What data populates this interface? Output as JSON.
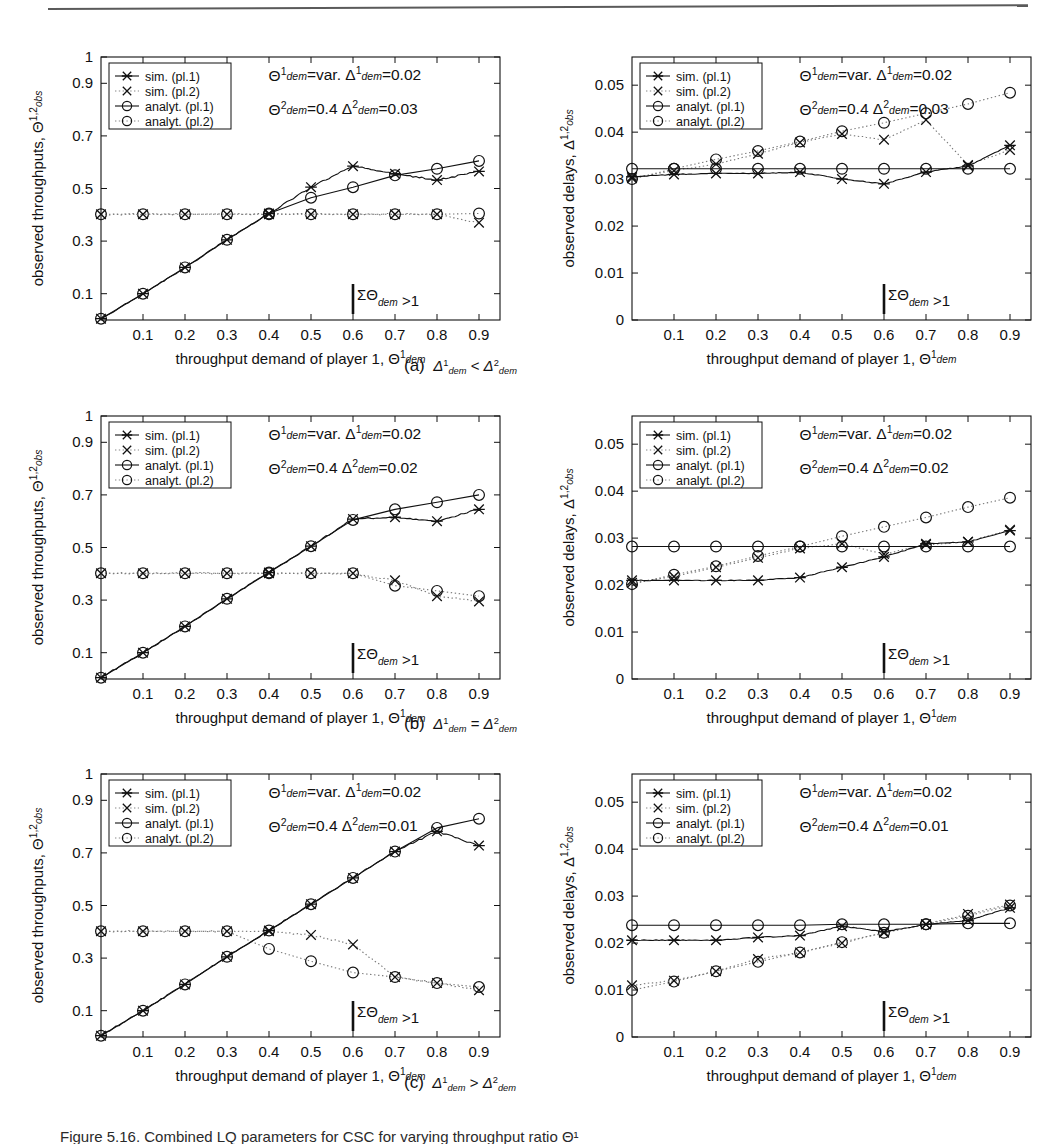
{
  "figure": {
    "panel_captions": [
      {
        "id": "a",
        "label": "(a)",
        "relation": "Δ¹dem < Δ²dem"
      },
      {
        "id": "b",
        "label": "(b)",
        "relation": "Δ¹dem = Δ²dem"
      },
      {
        "id": "c",
        "label": "(c)",
        "relation": "Δ¹dem > Δ²dem"
      }
    ],
    "bottom_caption": "Figure 5.16.   Combined LQ parameters for CSC for varying throughput ratio Θ¹"
  },
  "legend": {
    "entries": [
      {
        "key": "sim1",
        "label": "sim. (pl.1)",
        "marker": "star-line",
        "style": "solid"
      },
      {
        "key": "sim2",
        "label": "sim. (pl.2)",
        "marker": "cross",
        "style": "dotted"
      },
      {
        "key": "ana1",
        "label": "analyt. (pl.1)",
        "marker": "circle-line",
        "style": "solid"
      },
      {
        "key": "ana2",
        "label": "analyt. (pl.2)",
        "marker": "circle",
        "style": "dotted"
      }
    ]
  },
  "axes_common": {
    "xlabel_plain": "throughput demand of player 1, ",
    "xlabel_sym": "Θ",
    "xlabel_sup": "1",
    "xlabel_sub": "dem",
    "xticks": [
      "0.1",
      "0.2",
      "0.3",
      "0.4",
      "0.5",
      "0.6",
      "0.7",
      "0.8",
      "0.9"
    ],
    "xlim": [
      0,
      0.95
    ],
    "threshold_label": "ΣΘ",
    "threshold_sub": "dem",
    "threshold_rel": " >1",
    "threshold_x": 0.6
  },
  "chart_data": [
    {
      "id": "a-left",
      "type": "line",
      "title": "",
      "ylabel_plain": "observed throughputs, ",
      "ylabel_sym": "Θ",
      "ylabel_sup": "1,2",
      "ylabel_sub": "obs",
      "xlabel": "throughput demand of player 1, Θ¹dem",
      "xlim": [
        0,
        0.95
      ],
      "ylim": [
        0,
        1
      ],
      "yticks": [
        "0.1",
        "0.3",
        "0.5",
        "0.7",
        "0.9",
        "1"
      ],
      "ytickvals": [
        0.1,
        0.3,
        0.5,
        0.7,
        0.9,
        1.0
      ],
      "grid": false,
      "legend_position": "top-left",
      "annotations": [
        {
          "line": 1,
          "parts": [
            "Θ",
            "1",
            "dem",
            "=var.",
            "Δ",
            "1",
            "dem",
            "=0.02"
          ]
        },
        {
          "line": 2,
          "parts": [
            "Θ",
            "2",
            "dem",
            "=0.4",
            "Δ",
            "2",
            "dem",
            "=0.03"
          ]
        }
      ],
      "x": [
        0.0,
        0.1,
        0.2,
        0.3,
        0.4,
        0.5,
        0.6,
        0.7,
        0.8,
        0.9
      ],
      "series": [
        {
          "name": "analyt. (pl.1)",
          "marker": "circle",
          "style": "solid",
          "values": [
            0.005,
            0.1,
            0.2,
            0.305,
            0.405,
            0.465,
            0.505,
            0.55,
            0.575,
            0.605
          ]
        },
        {
          "name": "analyt. (pl.2)",
          "marker": "circle",
          "style": "dotted",
          "values": [
            0.402,
            0.402,
            0.402,
            0.402,
            0.402,
            0.402,
            0.402,
            0.402,
            0.402,
            0.405
          ]
        },
        {
          "name": "sim. (pl.1)",
          "marker": "star",
          "style": "solid",
          "values": [
            0.005,
            0.1,
            0.2,
            0.305,
            0.405,
            0.505,
            0.585,
            0.556,
            0.532,
            0.565
          ]
        },
        {
          "name": "sim. (pl.2)",
          "marker": "cross",
          "style": "dotted",
          "values": [
            0.402,
            0.402,
            0.402,
            0.402,
            0.402,
            0.402,
            0.402,
            0.402,
            0.402,
            0.37
          ]
        }
      ]
    },
    {
      "id": "a-right",
      "type": "line",
      "ylabel_plain": "observed delays, ",
      "ylabel_sym": "Δ",
      "ylabel_sup": "1,2",
      "ylabel_sub": "obs",
      "xlim": [
        0,
        0.95
      ],
      "ylim": [
        0,
        0.056
      ],
      "yticks": [
        "0.01",
        "0.02",
        "0.03",
        "0.04",
        "0.05",
        "0"
      ],
      "ytickvals": [
        0.01,
        0.02,
        0.03,
        0.04,
        0.05,
        0
      ],
      "grid": false,
      "legend_position": "top-left",
      "annotations": [
        {
          "line": 1,
          "parts": [
            "Θ",
            "1",
            "dem",
            "=var.",
            "Δ",
            "1",
            "dem",
            "=0.02"
          ]
        },
        {
          "line": 2,
          "parts": [
            "Θ",
            "2",
            "dem",
            "=0.4",
            "Δ",
            "2",
            "dem",
            "=0.03"
          ]
        }
      ],
      "x": [
        0.0,
        0.1,
        0.2,
        0.3,
        0.4,
        0.5,
        0.6,
        0.7,
        0.8,
        0.9
      ],
      "series": [
        {
          "name": "analyt. (pl.1)",
          "marker": "circle",
          "style": "solid",
          "values": [
            0.0322,
            0.0322,
            0.0322,
            0.0322,
            0.0322,
            0.0322,
            0.0322,
            0.0322,
            0.0322,
            0.0322
          ]
        },
        {
          "name": "analyt. (pl.2)",
          "marker": "circle",
          "style": "dotted",
          "values": [
            0.03,
            0.0322,
            0.0342,
            0.036,
            0.038,
            0.0402,
            0.042,
            0.044,
            0.046,
            0.0484
          ]
        },
        {
          "name": "sim. (pl.1)",
          "marker": "star",
          "style": "solid",
          "values": [
            0.0305,
            0.031,
            0.0312,
            0.0312,
            0.0315,
            0.03,
            0.029,
            0.0315,
            0.0328,
            0.0372
          ]
        },
        {
          "name": "sim. (pl.2)",
          "marker": "cross",
          "style": "dotted",
          "values": [
            0.0302,
            0.0318,
            0.0332,
            0.0354,
            0.0378,
            0.0396,
            0.0384,
            0.0426,
            0.033,
            0.0362
          ]
        }
      ]
    },
    {
      "id": "b-left",
      "type": "line",
      "ylabel_plain": "observed throughputs, ",
      "ylabel_sym": "Θ",
      "ylabel_sup": "1,2",
      "ylabel_sub": "obs",
      "xlim": [
        0,
        0.95
      ],
      "ylim": [
        0,
        1
      ],
      "yticks": [
        "0.1",
        "0.3",
        "0.5",
        "0.7",
        "0.9",
        "1"
      ],
      "ytickvals": [
        0.1,
        0.3,
        0.5,
        0.7,
        0.9,
        1.0
      ],
      "grid": false,
      "legend_position": "top-left",
      "annotations": [
        {
          "line": 1,
          "parts": [
            "Θ",
            "1",
            "dem",
            "=var.",
            "Δ",
            "1",
            "dem",
            "=0.02"
          ]
        },
        {
          "line": 2,
          "parts": [
            "Θ",
            "2",
            "dem",
            "=0.4",
            "Δ",
            "2",
            "dem",
            "=0.02"
          ]
        }
      ],
      "x": [
        0.0,
        0.1,
        0.2,
        0.3,
        0.4,
        0.5,
        0.6,
        0.7,
        0.8,
        0.9
      ],
      "series": [
        {
          "name": "analyt. (pl.1)",
          "marker": "circle",
          "style": "solid",
          "values": [
            0.005,
            0.1,
            0.2,
            0.305,
            0.405,
            0.505,
            0.605,
            0.645,
            0.672,
            0.7
          ]
        },
        {
          "name": "analyt. (pl.2)",
          "marker": "circle",
          "style": "dotted",
          "values": [
            0.402,
            0.402,
            0.402,
            0.402,
            0.402,
            0.402,
            0.402,
            0.355,
            0.335,
            0.315
          ]
        },
        {
          "name": "sim. (pl.1)",
          "marker": "star",
          "style": "solid",
          "values": [
            0.005,
            0.1,
            0.2,
            0.305,
            0.405,
            0.505,
            0.608,
            0.615,
            0.6,
            0.645
          ]
        },
        {
          "name": "sim. (pl.2)",
          "marker": "cross",
          "style": "dotted",
          "values": [
            0.402,
            0.402,
            0.402,
            0.402,
            0.402,
            0.402,
            0.402,
            0.375,
            0.315,
            0.295
          ]
        }
      ]
    },
    {
      "id": "b-right",
      "type": "line",
      "ylabel_plain": "observed delays, ",
      "ylabel_sym": "Δ",
      "ylabel_sup": "1,2",
      "ylabel_sub": "obs",
      "xlim": [
        0,
        0.95
      ],
      "ylim": [
        0,
        0.056
      ],
      "yticks": [
        "0.01",
        "0.02",
        "0.03",
        "0.04",
        "0.05",
        "0"
      ],
      "ytickvals": [
        0.01,
        0.02,
        0.03,
        0.04,
        0.05,
        0
      ],
      "grid": false,
      "legend_position": "top-left",
      "annotations": [
        {
          "line": 1,
          "parts": [
            "Θ",
            "1",
            "dem",
            "=var.",
            "Δ",
            "1",
            "dem",
            "=0.02"
          ]
        },
        {
          "line": 2,
          "parts": [
            "Θ",
            "2",
            "dem",
            "=0.4",
            "Δ",
            "2",
            "dem",
            "=0.02"
          ]
        }
      ],
      "x": [
        0.0,
        0.1,
        0.2,
        0.3,
        0.4,
        0.5,
        0.6,
        0.7,
        0.8,
        0.9
      ],
      "series": [
        {
          "name": "analyt. (pl.1)",
          "marker": "circle",
          "style": "solid",
          "values": [
            0.0282,
            0.0282,
            0.0282,
            0.0282,
            0.0282,
            0.0282,
            0.0282,
            0.0282,
            0.0282,
            0.0282
          ]
        },
        {
          "name": "analyt. (pl.2)",
          "marker": "circle",
          "style": "dotted",
          "values": [
            0.0202,
            0.0222,
            0.024,
            0.0262,
            0.0282,
            0.0304,
            0.0324,
            0.0344,
            0.0366,
            0.0386
          ]
        },
        {
          "name": "sim. (pl.1)",
          "marker": "star",
          "style": "solid",
          "values": [
            0.021,
            0.021,
            0.021,
            0.021,
            0.0216,
            0.0238,
            0.026,
            0.0288,
            0.0292,
            0.0316
          ]
        },
        {
          "name": "sim. (pl.2)",
          "marker": "cross",
          "style": "dotted",
          "values": [
            0.0205,
            0.0218,
            0.0238,
            0.0258,
            0.0278,
            0.0288,
            0.0266,
            0.0286,
            0.0292,
            0.0318
          ]
        }
      ]
    },
    {
      "id": "c-left",
      "type": "line",
      "ylabel_plain": "observed throughputs, ",
      "ylabel_sym": "Θ",
      "ylabel_sup": "1,2",
      "ylabel_sub": "obs",
      "xlim": [
        0,
        0.95
      ],
      "ylim": [
        0,
        1
      ],
      "yticks": [
        "0.1",
        "0.3",
        "0.5",
        "0.7",
        "0.9",
        "1"
      ],
      "ytickvals": [
        0.1,
        0.3,
        0.5,
        0.7,
        0.9,
        1.0
      ],
      "grid": false,
      "legend_position": "top-left",
      "annotations": [
        {
          "line": 1,
          "parts": [
            "Θ",
            "1",
            "dem",
            "=var.",
            "Δ",
            "1",
            "dem",
            "=0.02"
          ]
        },
        {
          "line": 2,
          "parts": [
            "Θ",
            "2",
            "dem",
            "=0.4",
            "Δ",
            "2",
            "dem",
            "=0.01"
          ]
        }
      ],
      "x": [
        0.0,
        0.1,
        0.2,
        0.3,
        0.4,
        0.5,
        0.6,
        0.7,
        0.8,
        0.9
      ],
      "series": [
        {
          "name": "analyt. (pl.1)",
          "marker": "circle",
          "style": "solid",
          "values": [
            0.005,
            0.1,
            0.2,
            0.305,
            0.405,
            0.505,
            0.605,
            0.705,
            0.795,
            0.83
          ]
        },
        {
          "name": "analyt. (pl.2)",
          "marker": "circle",
          "style": "dotted",
          "values": [
            0.402,
            0.402,
            0.402,
            0.402,
            0.335,
            0.288,
            0.245,
            0.228,
            0.205,
            0.19
          ]
        },
        {
          "name": "sim. (pl.1)",
          "marker": "star",
          "style": "solid",
          "values": [
            0.005,
            0.1,
            0.2,
            0.305,
            0.405,
            0.505,
            0.605,
            0.705,
            0.782,
            0.728
          ]
        },
        {
          "name": "sim. (pl.2)",
          "marker": "cross",
          "style": "dotted",
          "values": [
            0.402,
            0.402,
            0.402,
            0.402,
            0.402,
            0.388,
            0.352,
            0.228,
            0.205,
            0.178
          ]
        }
      ]
    },
    {
      "id": "c-right",
      "type": "line",
      "ylabel_plain": "observed delays, ",
      "ylabel_sym": "Δ",
      "ylabel_sup": "1,2",
      "ylabel_sub": "obs",
      "xlim": [
        0,
        0.95
      ],
      "ylim": [
        0,
        0.056
      ],
      "yticks": [
        "0.01",
        "0.02",
        "0.03",
        "0.04",
        "0.05",
        "0"
      ],
      "ytickvals": [
        0.01,
        0.02,
        0.03,
        0.04,
        0.05,
        0
      ],
      "grid": false,
      "legend_position": "top-left",
      "annotations": [
        {
          "line": 1,
          "parts": [
            "Θ",
            "1",
            "dem",
            "=var.",
            "Δ",
            "1",
            "dem",
            "=0.02"
          ]
        },
        {
          "line": 2,
          "parts": [
            "Θ",
            "2",
            "dem",
            "=0.4",
            "Δ",
            "2",
            "dem",
            "=0.01"
          ]
        }
      ],
      "x": [
        0.0,
        0.1,
        0.2,
        0.3,
        0.4,
        0.5,
        0.6,
        0.7,
        0.8,
        0.9
      ],
      "series": [
        {
          "name": "analyt. (pl.1)",
          "marker": "circle",
          "style": "solid",
          "values": [
            0.0238,
            0.0238,
            0.0238,
            0.0238,
            0.0238,
            0.024,
            0.024,
            0.024,
            0.0242,
            0.0242
          ]
        },
        {
          "name": "analyt. (pl.2)",
          "marker": "circle",
          "style": "dotted",
          "values": [
            0.01,
            0.0118,
            0.014,
            0.016,
            0.018,
            0.0202,
            0.0222,
            0.024,
            0.0258,
            0.028
          ]
        },
        {
          "name": "sim. (pl.1)",
          "marker": "star",
          "style": "solid",
          "values": [
            0.0206,
            0.0206,
            0.0206,
            0.0212,
            0.0216,
            0.0236,
            0.0224,
            0.024,
            0.0248,
            0.0275
          ]
        },
        {
          "name": "sim. (pl.2)",
          "marker": "cross",
          "style": "dotted",
          "values": [
            0.011,
            0.012,
            0.014,
            0.0166,
            0.018,
            0.02,
            0.0222,
            0.024,
            0.0262,
            0.0282
          ]
        }
      ]
    }
  ]
}
